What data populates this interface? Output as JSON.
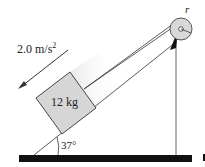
{
  "diagram": {
    "acceleration_label": "2.0 m/s",
    "acceleration_exp": "2",
    "mass_label": "12 kg",
    "angle_label": "37°",
    "pulley_label": "r",
    "colors": {
      "block": "#d6d6d6",
      "pulley": "#d9d9d9",
      "ground": "#111111",
      "line": "#333333"
    }
  }
}
